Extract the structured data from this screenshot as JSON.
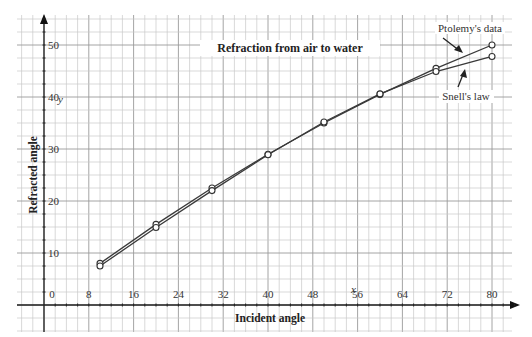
{
  "chart_data": {
    "type": "line",
    "title": "Refraction from air to water",
    "xlabel": "Incident angle",
    "ylabel": "Refracted angle",
    "x_var": "x",
    "y_var": "y",
    "xlim": [
      0,
      80
    ],
    "ylim": [
      0,
      50
    ],
    "x_ticks": [
      0,
      8,
      16,
      24,
      32,
      40,
      48,
      56,
      64,
      72,
      80
    ],
    "y_ticks": [
      10,
      20,
      30,
      40,
      50
    ],
    "grid": true,
    "x": [
      10,
      20,
      30,
      40,
      50,
      60,
      70,
      80
    ],
    "series": [
      {
        "name": "Ptolemy's data",
        "values": [
          8,
          15.5,
          22.5,
          29,
          35,
          40.5,
          45.5,
          50
        ]
      },
      {
        "name": "Snell's law",
        "values": [
          7.5,
          14.9,
          22.0,
          28.9,
          35.2,
          40.6,
          44.9,
          47.8
        ]
      }
    ],
    "annotations": [
      {
        "text": "Ptolemy's data",
        "points_to": "Ptolemy's data"
      },
      {
        "text": "Snell's law",
        "points_to": "Snell's law"
      }
    ],
    "legend": "annotations-top-right"
  }
}
